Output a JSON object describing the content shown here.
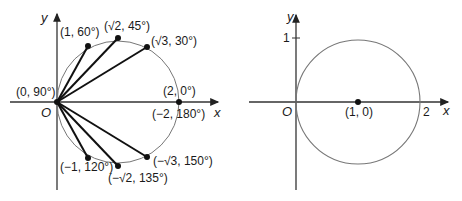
{
  "left_diagram": {
    "axis_x": "x",
    "axis_y": "y",
    "origin": "O",
    "points": [
      {
        "label": "(1, 60°)"
      },
      {
        "label": "(√2, 45°)"
      },
      {
        "label": "(√3, 30°)"
      },
      {
        "label": "(0, 90°)"
      },
      {
        "label": "(2, 0°)"
      },
      {
        "label": "(−2, 180°)"
      },
      {
        "label": "(−1, 120°)"
      },
      {
        "label": "(−√2, 135°)"
      },
      {
        "label": "(−√3, 150°)"
      }
    ]
  },
  "right_diagram": {
    "axis_x": "x",
    "axis_y": "y",
    "origin": "O",
    "tick_y": "1",
    "tick_x": "2",
    "center_label": "(1, 0)"
  }
}
